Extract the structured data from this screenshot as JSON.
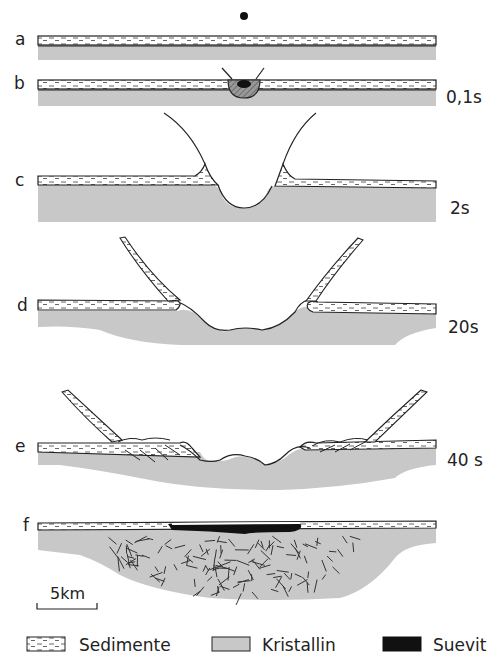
{
  "figure": {
    "stages": [
      {
        "id": "a",
        "label": "a",
        "time": ""
      },
      {
        "id": "b",
        "label": "b",
        "time": "0,1s"
      },
      {
        "id": "c",
        "label": "c",
        "time": "2s"
      },
      {
        "id": "d",
        "label": "d",
        "time": "20s"
      },
      {
        "id": "e",
        "label": "e",
        "time": "40 s"
      },
      {
        "id": "f",
        "label": "f",
        "time": ""
      }
    ],
    "scale_bar": {
      "label": "5km"
    },
    "legend": [
      {
        "key": "sediments",
        "label": "Sedimente"
      },
      {
        "key": "crystalline",
        "label": "Kristallin"
      },
      {
        "key": "suevite",
        "label": "Suevit"
      }
    ],
    "colors": {
      "sediment_fill": "#ffffff",
      "sediment_dash": "#555555",
      "crystalline_fill": "#c8c8c8",
      "suevite_fill": "#111111",
      "outline": "#222222"
    }
  }
}
